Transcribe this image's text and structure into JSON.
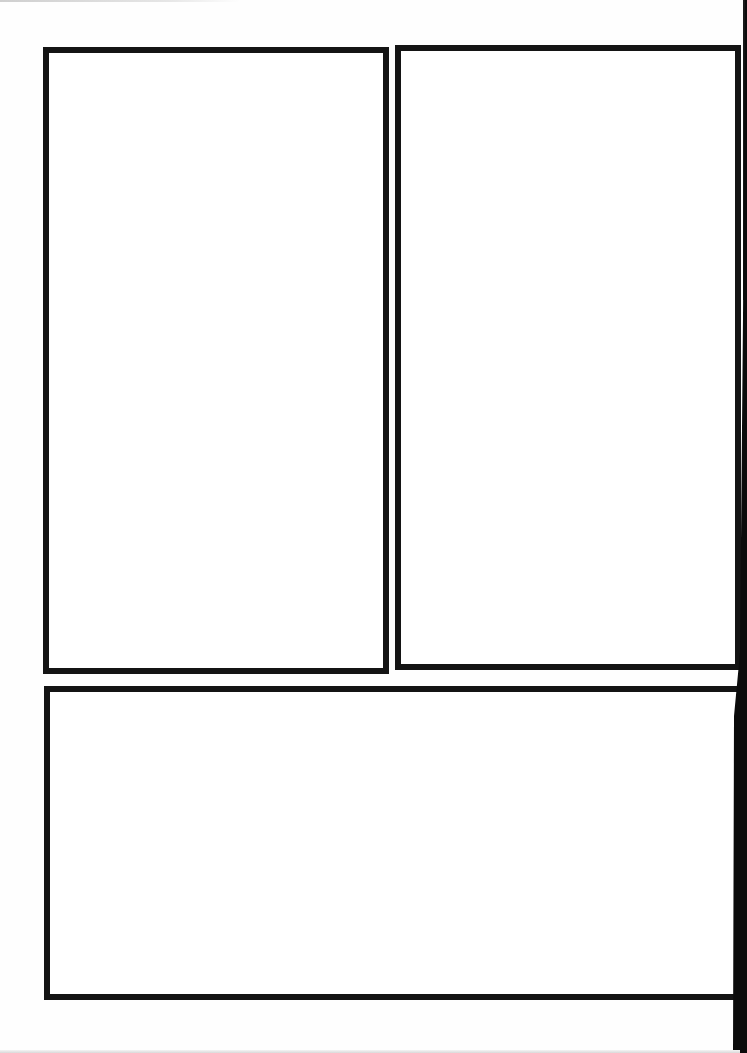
{
  "page": {
    "type": "blank-comic-panel-template",
    "background_color": "#ffffff",
    "border_color": "#141414",
    "panel_count": 3
  },
  "panels": [
    {
      "id": "panel-1",
      "position": "top-left",
      "content": ""
    },
    {
      "id": "panel-2",
      "position": "top-right",
      "content": ""
    },
    {
      "id": "panel-3",
      "position": "bottom-wide",
      "content": ""
    }
  ]
}
